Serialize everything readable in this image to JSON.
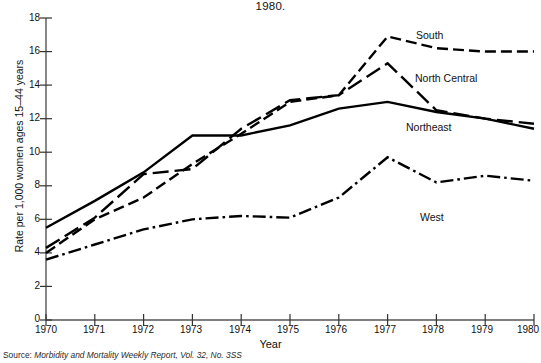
{
  "chart_data": {
    "type": "line",
    "title": "1980.",
    "xlabel": "Year",
    "ylabel": "Rate per 1,000 women ages 15–44 years",
    "x": [
      1970,
      1971,
      1972,
      1973,
      1974,
      1975,
      1976,
      1977,
      1978,
      1979,
      1980
    ],
    "xtick_labels": [
      "1970",
      "1971",
      "1972",
      "1973",
      "1974",
      "1975",
      "1976",
      "1977",
      "1978",
      "1979",
      "1980"
    ],
    "ytick_labels": [
      "0",
      "2",
      "4",
      "6",
      "8",
      "10",
      "12",
      "14",
      "16",
      "18"
    ],
    "ytick_values": [
      0,
      2,
      4,
      6,
      8,
      10,
      12,
      14,
      16,
      18
    ],
    "ylim": [
      0,
      18
    ],
    "xlim": [
      1970,
      1980
    ],
    "grid": false,
    "legend_position": "inline-right-annotations",
    "series": [
      {
        "name": "South",
        "label": "South",
        "linestyle": "dashed",
        "color": "#000000",
        "values": [
          4.0,
          6.0,
          7.3,
          9.3,
          11.1,
          13.0,
          13.4,
          16.9,
          16.2,
          16.0,
          16.0
        ]
      },
      {
        "name": "North Central",
        "label": "North Central",
        "linestyle": "long-dash",
        "color": "#000000",
        "values": [
          4.3,
          6.1,
          8.7,
          9.0,
          11.4,
          13.1,
          13.4,
          15.3,
          12.5,
          12.0,
          11.7
        ]
      },
      {
        "name": "Northeast",
        "label": "Northeast",
        "linestyle": "solid",
        "color": "#000000",
        "values": [
          5.5,
          7.1,
          8.8,
          11.0,
          11.0,
          11.6,
          12.6,
          13.0,
          12.4,
          12.0,
          11.4
        ]
      },
      {
        "name": "West",
        "label": "West",
        "linestyle": "dash-dot",
        "color": "#000000",
        "values": [
          3.6,
          4.5,
          5.4,
          6.0,
          6.2,
          6.1,
          7.3,
          9.7,
          8.2,
          8.6,
          8.3
        ]
      }
    ],
    "source_lead": "Source:",
    "source_text": " Morbidity and Mortality Weekly Report, Vol. 32, No. 3SS"
  }
}
